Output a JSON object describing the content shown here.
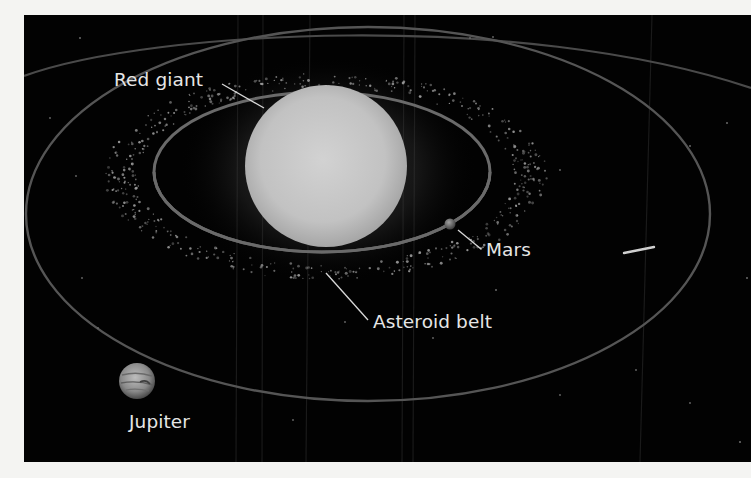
{
  "figure": {
    "background_color": "#020202",
    "frame_color": "#f4f4f2",
    "labels": {
      "red_giant": "Red giant",
      "mars": "Mars",
      "asteroid_belt": "Asteroid belt",
      "jupiter": "Jupiter"
    },
    "objects": [
      {
        "name": "Red giant",
        "type": "star",
        "color": "#c9c9c9"
      },
      {
        "name": "Mars",
        "type": "planet",
        "color": "#8a8a8a"
      },
      {
        "name": "Asteroid belt",
        "type": "belt",
        "color": "#9a9a9a"
      },
      {
        "name": "Jupiter",
        "type": "planet",
        "color": "#9c9c9c"
      },
      {
        "name": "Comet",
        "type": "streak",
        "color": "#d0d0d0"
      }
    ],
    "orbit_color": "#5a5a5a"
  }
}
